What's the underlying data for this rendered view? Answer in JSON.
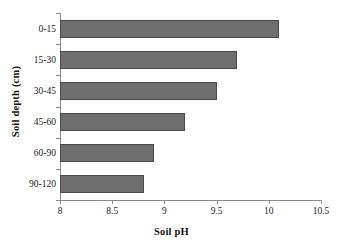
{
  "chart_data": {
    "type": "bar",
    "orientation": "horizontal",
    "title": "",
    "xlabel": "Soil pH",
    "ylabel": "Soil depth (cm)",
    "categories": [
      "0-15",
      "15-30",
      "30-45",
      "45-60",
      "60-90",
      "90-120"
    ],
    "values": [
      10.1,
      9.7,
      9.5,
      9.2,
      8.9,
      8.8
    ],
    "xlim": [
      8,
      10.5
    ],
    "xticks": [
      8,
      8.5,
      9,
      9.5,
      10,
      10.5
    ],
    "xtick_labels": [
      "8",
      "8.5",
      "9",
      "9.5",
      "10",
      "10.5"
    ],
    "grid": false,
    "legend": false,
    "bar_color": "#6e6e6e",
    "bar_border_color": "#4a4a4a",
    "axis_color": "#8a8a8a",
    "background": "#ffffff"
  }
}
